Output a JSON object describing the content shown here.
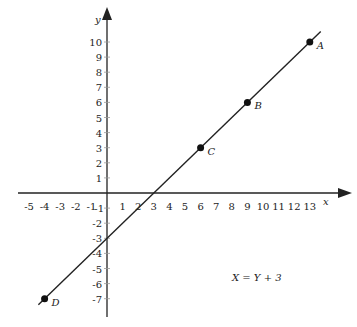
{
  "chart_data": {
    "type": "line",
    "title": "",
    "xlabel": "x",
    "ylabel": "y",
    "xlim": [
      -5,
      13
    ],
    "ylim": [
      -7,
      10
    ],
    "grid": false,
    "x_ticks": [
      -5,
      -4,
      -3,
      -2,
      -1,
      1,
      2,
      3,
      4,
      5,
      6,
      7,
      8,
      9,
      10,
      11,
      12,
      13
    ],
    "y_ticks": [
      -7,
      -6,
      -5,
      -4,
      -3,
      -2,
      -1,
      1,
      2,
      3,
      4,
      5,
      6,
      7,
      8,
      9,
      10
    ],
    "series": [
      {
        "name": "X = Y + 3",
        "x": [
          -4,
          14
        ],
        "y": [
          -7,
          11
        ]
      }
    ],
    "points": [
      {
        "label": "A",
        "x": 13,
        "y": 10
      },
      {
        "label": "B",
        "x": 9,
        "y": 6
      },
      {
        "label": "C",
        "x": 6,
        "y": 3
      },
      {
        "label": "D",
        "x": -4,
        "y": -7
      }
    ],
    "annotation": "X = Y + 3"
  }
}
